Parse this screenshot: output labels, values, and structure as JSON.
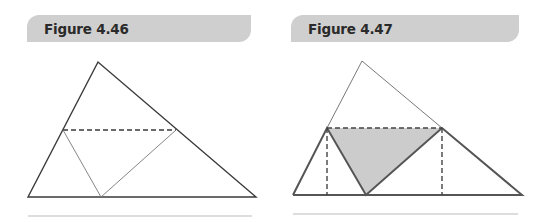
{
  "figures": [
    {
      "title": "Figure 4.46",
      "description": "Triangle with dashed midline; lower portion folded to touch the base",
      "outer_triangle": {
        "apex": [
          98,
          62
        ],
        "bottom_left": [
          28,
          197
        ],
        "bottom_right": [
          256,
          197
        ]
      },
      "dashed_midline": {
        "left": [
          63,
          130
        ],
        "right": [
          176,
          130
        ]
      },
      "fold_point": [
        101,
        197
      ]
    },
    {
      "title": "Figure 4.47",
      "description": "Folded triangle forming a rectangle-inscribed shaded triangle with dashed perpendiculars",
      "outer_triangle": {
        "apex": [
          362,
          61
        ],
        "bottom_left": [
          293,
          195
        ],
        "bottom_right": [
          522,
          195
        ]
      },
      "dashed_midline": {
        "left": [
          327,
          128
        ],
        "right": [
          442,
          128
        ]
      },
      "fold_point": [
        366,
        195
      ],
      "shaded_fill": "#cccccc"
    }
  ],
  "colors": {
    "header_bg": "#cfcfcf",
    "line_dark": "#3a3a3a",
    "line_thick": "#555555",
    "rule": "#bbbbbb"
  }
}
